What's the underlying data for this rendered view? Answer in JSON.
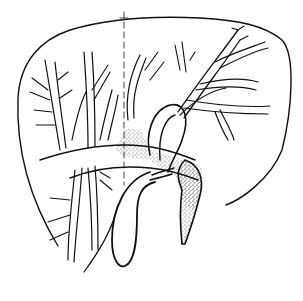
{
  "figure": {
    "type": "anatomical line drawing",
    "colors": {
      "background": "#ffffff",
      "ink": "#111111",
      "stipple": "#333333"
    },
    "labels": []
  }
}
